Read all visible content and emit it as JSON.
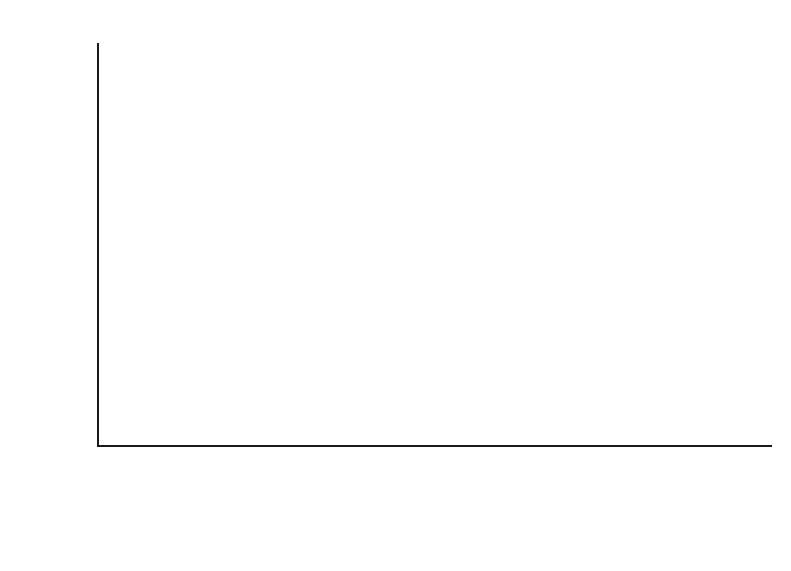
{
  "chart_data": {
    "type": "bar",
    "subtype": "stacked-bar",
    "title": "",
    "xlabel": "",
    "ylabel": "Percentage",
    "ylim": [
      0,
      90
    ],
    "ytick_step": 10,
    "yticks": [
      "90",
      "80",
      "70",
      "60",
      "50",
      "40",
      "30",
      "20",
      "10",
      "0"
    ],
    "grid": false,
    "legend_position": "bottom",
    "categories": [
      {
        "line1": "African",
        "line2": "Americans"
      },
      {
        "line1": "Hispanic",
        "line2": "Americans"
      },
      {
        "line1": "Asian",
        "line2": "Americans"
      },
      {
        "line1": "American",
        "line2": "Indians"
      },
      {
        "line1": "Euro-",
        "line2": "Americans"
      }
    ],
    "series": [
      {
        "name": "High school graduate",
        "color": "#b2b2b2",
        "values": [
          74.9,
          54.7,
          84.9,
          65.5,
          86.3
        ],
        "labels": [
          "74.9%",
          "54.7%",
          "84.9%",
          "65.5%",
          "86.3%"
        ]
      },
      {
        "name": "College graduate",
        "color": "#3a3a3a",
        "values": [
          13.3,
          10.3,
          42.2,
          9.3,
          26.2
        ],
        "labels": [
          "13.3%",
          "10.3%",
          "42.2%",
          "9.3%",
          "26.2%"
        ]
      }
    ]
  },
  "legend": {
    "items": [
      {
        "label": "High school graduate",
        "swatch": "light"
      },
      {
        "label": "College graduate",
        "swatch": "dark"
      }
    ]
  }
}
